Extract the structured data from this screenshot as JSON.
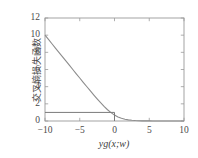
{
  "chart_data": {
    "type": "line",
    "title": "",
    "subtitle": "",
    "xlabel": "yg(x;w)",
    "ylabel": "交叉熵损失函数",
    "xlim": [
      -10,
      10
    ],
    "ylim": [
      0,
      12
    ],
    "xticks": [
      -10,
      -5,
      0,
      5,
      10
    ],
    "xticklabels": [
      "−10",
      "−5",
      "0",
      "5",
      "10"
    ],
    "yticks": [
      0,
      2,
      4,
      6,
      8,
      10,
      12
    ],
    "yticklabels": [
      "0",
      "2",
      "4",
      "6",
      "8",
      "10",
      "12"
    ],
    "grid": false,
    "legend": null,
    "legend_position": "none",
    "series": [
      {
        "name": "交叉熵损失 log(1+exp(-z))",
        "color": "#8c8c8c",
        "linewidth": 1.1,
        "x": [
          -10,
          -9.5,
          -9,
          -8.5,
          -8,
          -7.5,
          -7,
          -6.5,
          -6,
          -5.5,
          -5,
          -4.5,
          -4,
          -3.5,
          -3,
          -2.5,
          -2,
          -1.5,
          -1,
          -0.5,
          0,
          0.5,
          1,
          1.5,
          2,
          2.5,
          3,
          3.5,
          4,
          4.5,
          5,
          5.5,
          6,
          6.5,
          7,
          7.5,
          8,
          8.5,
          9,
          9.5,
          10
        ],
        "y": [
          10.0,
          9.5,
          9.0,
          8.5,
          8.0,
          7.5,
          7.0,
          6.5,
          6.0,
          5.5,
          5.01,
          4.51,
          4.02,
          3.53,
          3.05,
          2.58,
          2.13,
          1.7,
          1.31,
          0.97,
          0.69,
          0.47,
          0.31,
          0.2,
          0.13,
          0.08,
          0.05,
          0.03,
          0.02,
          0.01,
          0.01,
          0.0,
          0.0,
          0.0,
          0.0,
          0.0,
          0.0,
          0.0,
          0.0,
          0.0,
          0.0
        ]
      },
      {
        "name": "0-1损失",
        "color": "#7a7a7a",
        "linewidth": 1.0,
        "x": [
          -10,
          0,
          0
        ],
        "y": [
          1,
          1,
          0
        ]
      }
    ],
    "axes_color": "#9a9a9a",
    "text_color": "#4a4a4a",
    "background": "#ffffff"
  },
  "figure": {
    "plot_left_px": 45,
    "plot_right_px": 184,
    "plot_top_px": 18,
    "plot_bottom_px": 121
  }
}
